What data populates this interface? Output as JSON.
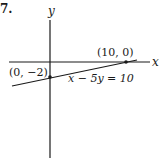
{
  "problem_number": "7.",
  "axes": {
    "x_label": "x",
    "y_label": "y"
  },
  "points": [
    {
      "label": "(10, 0)",
      "x": 10,
      "y": 0
    },
    {
      "label": "(0, −2)",
      "x": 0,
      "y": -2
    }
  ],
  "line": {
    "equation": "x − 5y = 10"
  },
  "colors": {
    "ink": "#1a1a1a",
    "background": "#ffffff"
  }
}
